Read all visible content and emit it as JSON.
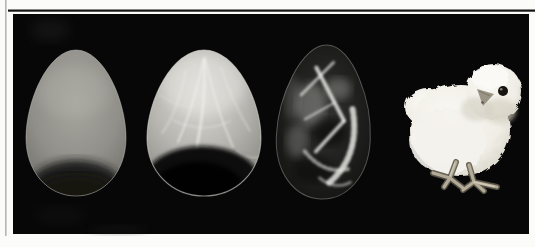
{
  "page": {
    "background_color": "#fbfbf9"
  },
  "frame": {
    "left_rule_color": "#b5b5b1",
    "top_rule_color": "#141414",
    "panel_color": "#070707"
  },
  "figure": {
    "alt": "Four-stage chick development photo sequence on black: candled egg, candled egg with veins and embryo shadow, X-ray egg showing embryo skeleton, hatched white chick",
    "items": [
      {
        "id": "candled-egg-stage-1",
        "highlight_color": "#a7a69f",
        "base_color": "#908f89",
        "edge_color": "#6b6a64",
        "shadow_color": "#1c1c1a"
      },
      {
        "id": "candled-egg-stage-2",
        "highlight_color": "#dedcd6",
        "base_color": "#b6b5b0",
        "edge_color": "#81817c",
        "vein_color": "#f2f2ee",
        "shadow_color": "#0b0b0a"
      },
      {
        "id": "xray-egg-embryo",
        "center_color": "#323230",
        "edge_color": "#0d0d0c",
        "bone_color": "#e6e6e2"
      },
      {
        "id": "hatched-chick",
        "body_highlight": "#faf8f3",
        "body_color": "#efede5",
        "body_edge": "#ccc8bb",
        "eye_color": "#171310",
        "beak_color": "#9a9486",
        "leg_color": "#b3ab97",
        "leg_shadow": "#5f594c"
      }
    ]
  }
}
